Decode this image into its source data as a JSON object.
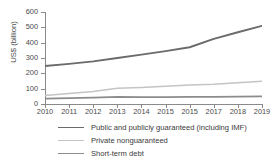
{
  "chart_data": {
    "type": "line",
    "title": "",
    "xlabel": "",
    "ylabel": "US$ (billion)",
    "x": [
      2010,
      2011,
      2012,
      2013,
      2014,
      2015,
      2016,
      2017,
      2018,
      2019
    ],
    "xtick_labels": [
      "2010",
      "2011",
      "2012",
      "2013",
      "2014",
      "2015",
      "2015",
      "2017",
      "2018",
      "2019"
    ],
    "ytick_labels": [
      "0",
      "100",
      "200",
      "300",
      "400",
      "500",
      "600"
    ],
    "ytick_values": [
      0,
      100,
      200,
      300,
      400,
      500,
      600
    ],
    "ylim": [
      0,
      600
    ],
    "xlim": [
      2010,
      2019
    ],
    "grid": false,
    "legend_position": "bottom-left",
    "series": [
      {
        "name": "Public and publicly guaranteed (including IMF)",
        "color": "#6b6b6b",
        "width": 1.9,
        "values": [
          248,
          262,
          278,
          300,
          322,
          345,
          370,
          425,
          468,
          510
        ]
      },
      {
        "name": "Private nonguaranteed",
        "color": "#c4c4c4",
        "width": 1.5,
        "values": [
          55,
          68,
          82,
          102,
          108,
          116,
          124,
          128,
          138,
          148
        ]
      },
      {
        "name": "Short-term debt",
        "color": "#8c8c8c",
        "width": 1.7,
        "values": [
          35,
          38,
          41,
          46,
          45,
          45,
          46,
          47,
          48,
          50
        ]
      }
    ]
  },
  "legend": {
    "items": [
      {
        "label": "Public and publicly guaranteed (including IMF)",
        "color": "#6b6b6b",
        "width": 1.9
      },
      {
        "label": "Private nonguaranteed",
        "color": "#c4c4c4",
        "width": 1.5
      },
      {
        "label": "Short-term debt",
        "color": "#8c8c8c",
        "width": 1.7
      }
    ]
  }
}
